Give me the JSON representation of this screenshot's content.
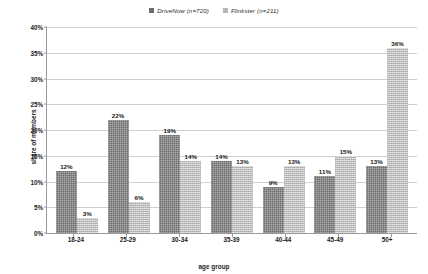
{
  "chart_data": {
    "type": "bar",
    "title": "",
    "xlabel": "age group",
    "ylabel": "share of members",
    "ylim": [
      0,
      40
    ],
    "ytick_labels": [
      "0%",
      "5%",
      "10%",
      "15%",
      "20%",
      "25%",
      "30%",
      "35%",
      "40%"
    ],
    "ytick_values": [
      0,
      5,
      10,
      15,
      20,
      25,
      30,
      35,
      40
    ],
    "grid": "horizontal",
    "legend_position": "top-center",
    "categories": [
      "18-24",
      "25-29",
      "30-34",
      "35-39",
      "40-44",
      "45-49",
      "50+"
    ],
    "series": [
      {
        "name": "DriveNow (n=720)",
        "color": "#6d6d6d",
        "values": [
          12,
          22,
          19,
          14,
          9,
          11,
          13
        ],
        "labels": [
          "12%",
          "22%",
          "19%",
          "14%",
          "9%",
          "11%",
          "13%"
        ]
      },
      {
        "name": "Flinkster (n=211)",
        "color": "#bcbcbc",
        "values": [
          3,
          6,
          14,
          13,
          13,
          15,
          36
        ],
        "labels": [
          "3%",
          "6%",
          "14%",
          "13%",
          "13%",
          "15%",
          "36%"
        ]
      }
    ]
  }
}
